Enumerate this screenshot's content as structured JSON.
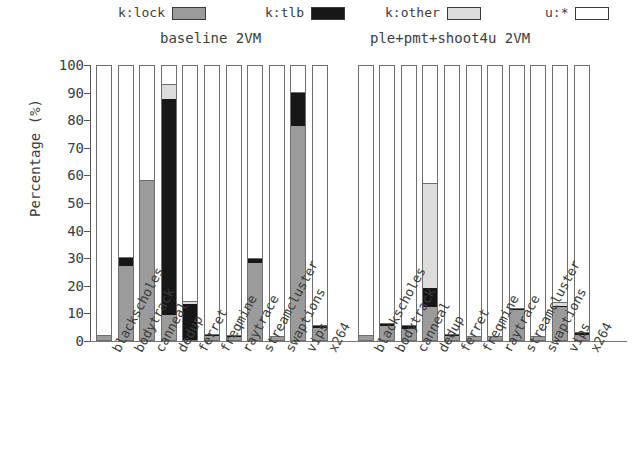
{
  "chart_data": {
    "type": "bar",
    "subtype": "stacked-percentage",
    "title": "",
    "xlabel": "",
    "ylabel": "Percentage (%)",
    "ylim": [
      0,
      100
    ],
    "yticks": [
      0,
      10,
      20,
      30,
      40,
      50,
      60,
      70,
      80,
      90,
      100
    ],
    "grid": false,
    "legend_position": "top",
    "legend": [
      "k:lock",
      "k:tlb",
      "k:other",
      "u:*"
    ],
    "series_colors": {
      "k:lock": "#9b9b9b",
      "k:tlb": "#171717",
      "k:other": "#dcdcdc",
      "u:*": "#ffffff"
    },
    "groups": [
      {
        "name": "baseline 2VM",
        "categories": [
          "blackscholes",
          "bodytrack",
          "canneal",
          "dedup",
          "ferret",
          "freqmine",
          "raytrace",
          "streamcluster",
          "swaptions",
          "vips",
          "x264"
        ],
        "series": [
          {
            "name": "k:lock",
            "values": [
              1.5,
              27.0,
              58.0,
              9.0,
              0.0,
              1.5,
              1.0,
              28.0,
              1.0,
              78.0,
              4.5
            ]
          },
          {
            "name": "k:tlb",
            "values": [
              0.0,
              3.0,
              0.0,
              79.0,
              13.0,
              0.5,
              0.5,
              1.5,
              0.0,
              12.0,
              0.5
            ]
          },
          {
            "name": "k:other",
            "values": [
              0.0,
              0.0,
              0.0,
              5.0,
              1.0,
              0.0,
              0.0,
              0.0,
              0.0,
              0.0,
              0.0
            ]
          },
          {
            "name": "u:*",
            "values": [
              98.5,
              70.0,
              42.0,
              7.0,
              86.0,
              98.0,
              98.5,
              70.5,
              99.0,
              10.0,
              95.0
            ]
          }
        ]
      },
      {
        "name": "ple+pmt+shoot4u 2VM",
        "categories": [
          "blackscholes",
          "bodytrack",
          "canneal",
          "dedup",
          "ferret",
          "freqmine",
          "raytrace",
          "streamcluster",
          "swaptions",
          "vips",
          "x264"
        ],
        "series": [
          {
            "name": "k:lock",
            "values": [
              1.5,
              5.0,
              4.0,
              12.0,
              1.5,
              1.0,
              1.0,
              11.0,
              1.0,
              12.0,
              2.0
            ]
          },
          {
            "name": "k:tlb",
            "values": [
              0.0,
              1.0,
              1.0,
              7.0,
              0.5,
              0.0,
              0.0,
              0.5,
              0.0,
              0.5,
              0.5
            ]
          },
          {
            "name": "k:other",
            "values": [
              0.0,
              0.0,
              0.0,
              38.0,
              0.0,
              0.0,
              0.0,
              0.0,
              0.0,
              1.0,
              0.0
            ]
          },
          {
            "name": "u:*",
            "values": [
              98.5,
              94.0,
              95.0,
              43.0,
              98.0,
              99.0,
              99.0,
              88.5,
              99.0,
              86.5,
              97.5
            ]
          }
        ]
      }
    ]
  }
}
